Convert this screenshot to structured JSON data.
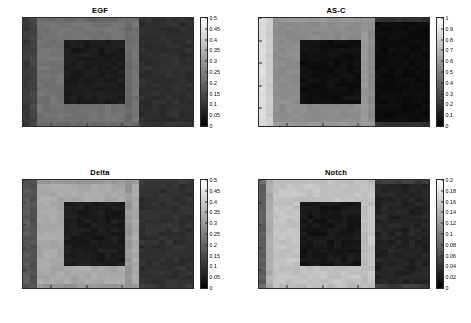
{
  "figure": {
    "layout": "2x2-grid",
    "background_color": "#ffffff",
    "colormap": "gray"
  },
  "chart_data": [
    {
      "type": "heatmap",
      "title": "EGF",
      "xlabel": "",
      "ylabel": "",
      "xlim": [
        1,
        25
      ],
      "ylim": [
        1,
        25
      ],
      "xticks": [
        5,
        10,
        15,
        20,
        25
      ],
      "yticks": [
        5,
        10,
        15,
        20,
        25
      ],
      "grid": false,
      "colormap": "gray",
      "colorbar": {
        "min": 0,
        "max": 0.5,
        "ticks": [
          0,
          0.05,
          0.1,
          0.15,
          0.2,
          0.25,
          0.3,
          0.35,
          0.4,
          0.45,
          0.5
        ],
        "tick_labels": [
          "0",
          "0.05",
          "0.1",
          "0.15",
          "0.2",
          "0.25",
          "0.3",
          "0.35",
          "0.4",
          "0.45",
          "0.5"
        ],
        "position": "right"
      },
      "description": "Low-level EGF field; faint elevated band near x=16-17 and a mid-grey border region surrounding a darker central rectangle",
      "levels": {
        "background": 0.115,
        "outer_ring": 0.135,
        "inner_core": 0.055,
        "bright_band": 0.225,
        "right_region": 0.09
      },
      "noise_amplitude": 0.012
    },
    {
      "type": "heatmap",
      "title": "AS-C",
      "xlabel": "",
      "ylabel": "",
      "xlim": [
        1,
        25
      ],
      "ylim": [
        1,
        25
      ],
      "xticks": [
        5,
        10,
        15,
        20,
        25
      ],
      "yticks": [
        5,
        10,
        15,
        20,
        25
      ],
      "grid": false,
      "colormap": "gray",
      "colorbar": {
        "min": 0,
        "max": 1,
        "ticks": [
          0,
          0.1,
          0.2,
          0.3,
          0.4,
          0.5,
          0.6,
          0.7,
          0.8,
          0.9,
          1
        ],
        "tick_labels": [
          "0",
          "0.1",
          "0.2",
          "0.3",
          "0.4",
          "0.5",
          "0.6",
          "0.7",
          "0.8",
          "0.9",
          "1"
        ],
        "position": "right"
      },
      "description": "Bright C-shaped / notch-shaped high-expression region occupying the left margin and wrapping around a dark central rectangle; right half is near zero",
      "levels": {
        "background": 0.86,
        "outer_ring": 0.8,
        "inner_core": 0.06,
        "bright_band": 0.55,
        "right_region": 0.05
      },
      "noise_amplitude": 0.02
    },
    {
      "type": "heatmap",
      "title": "Delta",
      "xlabel": "",
      "ylabel": "",
      "xlim": [
        1,
        25
      ],
      "ylim": [
        1,
        25
      ],
      "xticks": [
        5,
        10,
        15,
        20,
        25
      ],
      "yticks": [
        5,
        10,
        15,
        20,
        25
      ],
      "grid": false,
      "colormap": "gray",
      "colorbar": {
        "min": 0,
        "max": 0.5,
        "ticks": [
          0,
          0.05,
          0.1,
          0.15,
          0.2,
          0.25,
          0.3,
          0.35,
          0.4,
          0.45,
          0.5
        ],
        "tick_labels": [
          "0",
          "0.05",
          "0.1",
          "0.15",
          "0.2",
          "0.25",
          "0.3",
          "0.35",
          "0.4",
          "0.45",
          "0.5"
        ],
        "position": "right"
      },
      "description": "Mid-grey field with a bright narrow U-shaped band tracing the inner boundary of the notch around x=6-7 and along y=5-6 and y=20-21",
      "levels": {
        "background": 0.175,
        "outer_ring": 0.16,
        "inner_core": 0.055,
        "bright_band": 0.33,
        "right_region": 0.095
      },
      "noise_amplitude": 0.014
    },
    {
      "type": "heatmap",
      "title": "Notch",
      "xlabel": "",
      "ylabel": "",
      "xlim": [
        1,
        25
      ],
      "ylim": [
        1,
        25
      ],
      "xticks": [
        5,
        10,
        15,
        20,
        25
      ],
      "yticks": [
        5,
        10,
        15,
        20,
        25
      ],
      "grid": false,
      "colormap": "gray",
      "colorbar": {
        "min": 0,
        "max": 0.2,
        "ticks": [
          0,
          0.02,
          0.04,
          0.06,
          0.08,
          0.1,
          0.12,
          0.14,
          0.16,
          0.18,
          0.2
        ],
        "tick_labels": [
          "0",
          "0.02",
          "0.04",
          "0.06",
          "0.08",
          "0.1",
          "0.12",
          "0.14",
          "0.16",
          "0.18",
          "0.2"
        ],
        "position": "right"
      },
      "description": "Bright broad C-shaped Notch activity band filling x=3-15 on the left and wrapping the dark central rectangle; dark at far left edge and over the whole right half",
      "levels": {
        "background": 0.072,
        "outer_ring": 0.135,
        "inner_core": 0.018,
        "bright_band": 0.152,
        "right_region": 0.028
      },
      "noise_amplitude": 0.006
    }
  ]
}
